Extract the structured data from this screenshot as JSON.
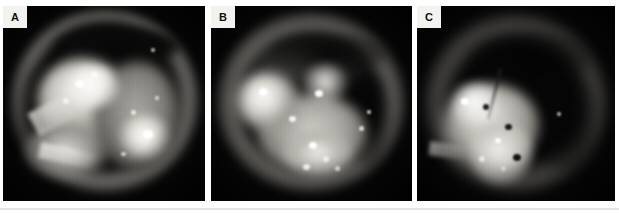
{
  "figure": {
    "kind": "medical-photograph-panel-series",
    "modality": "otoendoscopy",
    "colorspace": "grayscale",
    "panel_count": 3,
    "background_color": "#ffffff",
    "divider_color": "#e3e3e3",
    "label_chip_bg": "#f2f2f0",
    "label_chip_fg": "#111111",
    "panels": [
      {
        "id": "panel-a",
        "label": "A",
        "description": "Grayscale endoscopic view of an ear canal and tympanic membrane with a bright lobulated mass filling the upper-left field and a specular highlight lower right."
      },
      {
        "id": "panel-b",
        "label": "B",
        "description": "Grayscale endoscopic view showing a pale granular mass occupying the central and left field with a dark crescent along the superior canal wall."
      },
      {
        "id": "panel-c",
        "label": "C",
        "description": "Grayscale endoscopic view with a bright irregular lesion in the lower-left quadrant and a dark recess occupying the right half of the field."
      }
    ]
  }
}
